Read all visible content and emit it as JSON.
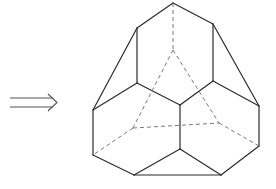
{
  "figure": {
    "arrow": {
      "symbol": "double-arrow-right",
      "x1": 10,
      "x2": 57,
      "y_top": 98,
      "y_bottom": 107,
      "tip": [
        57,
        102
      ]
    },
    "colors": {
      "edge": "#2b2b2b",
      "hidden_edge": "#6a6a6a",
      "arrow": "#555555",
      "background": "#ffffff"
    },
    "vertices": {
      "T": [
        173,
        3
      ],
      "UL": [
        137,
        28
      ],
      "UR": [
        213,
        24
      ],
      "ML": [
        137,
        83
      ],
      "MR": [
        213,
        81
      ],
      "C": [
        180,
        105
      ],
      "OL": [
        93,
        110
      ],
      "OR": [
        259,
        106
      ],
      "LL": [
        93,
        155
      ],
      "LR": [
        259,
        146
      ],
      "CL": [
        180,
        149
      ],
      "BL": [
        134,
        175
      ],
      "BR": [
        221,
        175
      ],
      "H_top": [
        173,
        50
      ],
      "H_left": [
        133,
        128
      ],
      "H_right": [
        219,
        123
      ]
    },
    "solid_edges": [
      [
        "T",
        "UL"
      ],
      [
        "T",
        "UR"
      ],
      [
        "UL",
        "ML"
      ],
      [
        "UR",
        "MR"
      ],
      [
        "UL",
        "OL"
      ],
      [
        "UR",
        "OR"
      ],
      [
        "ML",
        "OL"
      ],
      [
        "ML",
        "C"
      ],
      [
        "MR",
        "C"
      ],
      [
        "MR",
        "OR"
      ],
      [
        "OL",
        "LL"
      ],
      [
        "OR",
        "LR"
      ],
      [
        "C",
        "CL"
      ],
      [
        "LL",
        "BL"
      ],
      [
        "LR",
        "BR"
      ],
      [
        "CL",
        "BL"
      ],
      [
        "CL",
        "BR"
      ],
      [
        "BL",
        "BR"
      ]
    ],
    "hidden_edges": [
      [
        "T",
        "H_top"
      ],
      [
        "H_top",
        "H_left"
      ],
      [
        "H_top",
        "H_right"
      ],
      [
        "H_left",
        "H_right"
      ],
      [
        "H_left",
        "LL"
      ],
      [
        "H_right",
        "LR"
      ]
    ]
  }
}
